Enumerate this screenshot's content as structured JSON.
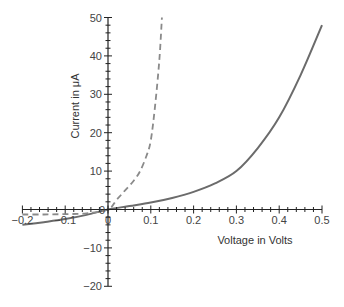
{
  "chart_data": {
    "type": "line",
    "title": "",
    "xlabel": "Voltage in Volts",
    "ylabel": "Current in μA",
    "xlim": [
      -0.2,
      0.5
    ],
    "ylim": [
      -20,
      50
    ],
    "grid": false,
    "legend": null,
    "x_ticks": [
      -0.2,
      -0.1,
      0,
      0.1,
      0.2,
      0.3,
      0.4,
      0.5
    ],
    "x_tick_labels": [
      "−0.2",
      "−0.1",
      "0",
      "0.1",
      "0.2",
      "0.3",
      "0.4",
      "0.5"
    ],
    "y_ticks": [
      -20,
      -10,
      0,
      10,
      20,
      30,
      40,
      50
    ],
    "y_tick_labels": [
      "−20",
      "−10",
      "0",
      "10",
      "20",
      "30",
      "40",
      "50"
    ],
    "series": [
      {
        "name": "solid curve",
        "style": "solid",
        "color": "#6b6b6b",
        "x": [
          -0.2,
          -0.15,
          -0.1,
          -0.05,
          0,
          0.05,
          0.1,
          0.15,
          0.2,
          0.25,
          0.3,
          0.35,
          0.4,
          0.45,
          0.5
        ],
        "y": [
          -4.0,
          -3.3,
          -2.5,
          -1.4,
          0,
          0.9,
          1.8,
          3.0,
          4.6,
          6.8,
          10.0,
          16.0,
          24.0,
          35.0,
          48.0
        ]
      },
      {
        "name": "dashed curve",
        "style": "dashed",
        "color": "#8a8a8a",
        "x": [
          -0.2,
          -0.15,
          -0.1,
          -0.05,
          0,
          0.02,
          0.04,
          0.06,
          0.075,
          0.09,
          0.1,
          0.11,
          0.12,
          0.126
        ],
        "y": [
          -1.3,
          -1.3,
          -1.2,
          -1.0,
          0,
          2.5,
          5.0,
          7.5,
          10.0,
          14.0,
          18.0,
          27.0,
          39.0,
          50.0
        ]
      }
    ]
  }
}
